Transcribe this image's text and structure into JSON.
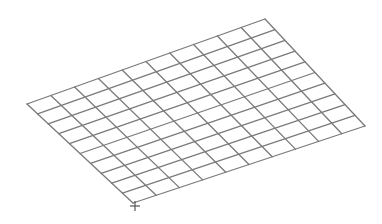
{
  "diagram": {
    "type": "wireframe-grid",
    "rows": 10,
    "columns": 10,
    "corners": {
      "left": [
        27,
        104
      ],
      "top": [
        265,
        19
      ],
      "right": [
        365,
        126
      ],
      "bottom": [
        133,
        203
      ]
    },
    "line_color": "#7a7a7a",
    "line_width": 1.3,
    "background": "#ffffff",
    "origin_marker": {
      "icon": "crosshair-icon",
      "position": [
        135,
        206
      ],
      "size": 5,
      "color": "#555555"
    }
  }
}
